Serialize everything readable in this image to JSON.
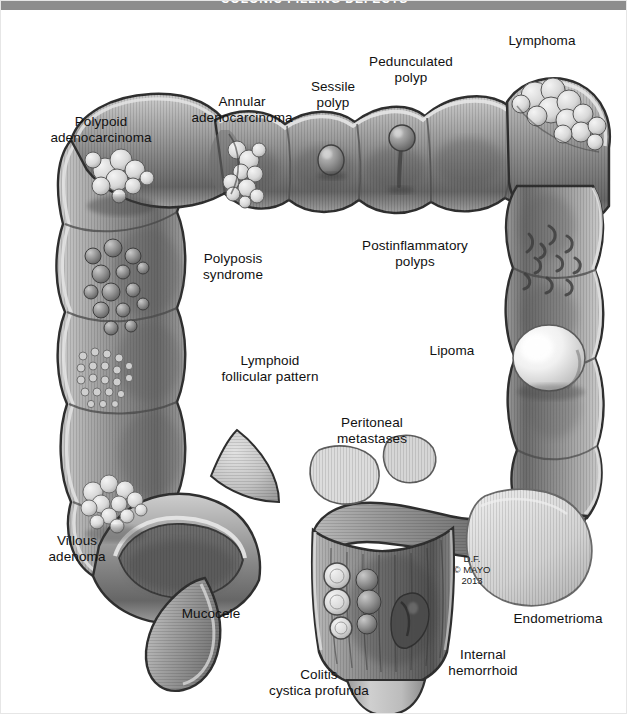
{
  "banner": {
    "text": "COLONIC FILLING DEFECTS"
  },
  "figure": {
    "credit": "D.F.\n© MAYO\n2013",
    "labels": [
      {
        "id": "polypoid-adenocarcinoma",
        "text": "Polypoid\nadenocarcinoma",
        "x": 30,
        "y": 104,
        "align": "c",
        "w": 140
      },
      {
        "id": "annular-adenocarcinoma",
        "text": "Annular\nadenocarcinoma",
        "x": 176,
        "y": 84,
        "align": "c",
        "w": 130
      },
      {
        "id": "sessile-polyp",
        "text": "Sessile\npolyp",
        "x": 297,
        "y": 69,
        "align": "c",
        "w": 70
      },
      {
        "id": "pedunculated-polyp",
        "text": "Pedunculated\npolyp",
        "x": 355,
        "y": 44,
        "align": "c",
        "w": 110
      },
      {
        "id": "lymphoma",
        "text": "Lymphoma",
        "x": 495,
        "y": 23,
        "align": "c",
        "w": 92
      },
      {
        "id": "postinflammatory-polyps",
        "text": "Postinflammatory\npolyps",
        "x": 348,
        "y": 228,
        "align": "c",
        "w": 132
      },
      {
        "id": "lipoma",
        "text": "Lipoma",
        "x": 420,
        "y": 333,
        "align": "c",
        "w": 62
      },
      {
        "id": "polyposis-syndrome",
        "text": "Polyposis\nsyndrome",
        "x": 186,
        "y": 241,
        "align": "c",
        "w": 92
      },
      {
        "id": "lymphoid-follicular",
        "text": "Lymphoid\nfollicular pattern",
        "x": 206,
        "y": 343,
        "align": "c",
        "w": 126
      },
      {
        "id": "peritoneal-metastases",
        "text": "Peritoneal\nmetastases",
        "x": 323,
        "y": 405,
        "align": "c",
        "w": 96
      },
      {
        "id": "villous-adenoma",
        "text": "Villous\nadenoma",
        "x": 34,
        "y": 523,
        "align": "c",
        "w": 84
      },
      {
        "id": "mucocele",
        "text": "Mucocele",
        "x": 168,
        "y": 596,
        "align": "c",
        "w": 84
      },
      {
        "id": "colitis-cystica-profunda",
        "text": "Colitis\ncystica profunda",
        "x": 255,
        "y": 657,
        "align": "c",
        "w": 126
      },
      {
        "id": "internal-hemorrhoid",
        "text": "Internal\nhemorrhoid",
        "x": 436,
        "y": 637,
        "align": "c",
        "w": 92
      },
      {
        "id": "endometrioma",
        "text": "Endometrioma",
        "x": 500,
        "y": 601,
        "align": "c",
        "w": 114
      }
    ]
  },
  "palette": {
    "banner_bg": "#8d8d8d",
    "page_bg": "#ffffff",
    "wall_outline": "#3a3a3a",
    "serosa_light": "#d7d7d7",
    "mucosa_mid": "#9a9a9a",
    "mucosa_dark": "#5e5e5e",
    "lumen_shadow": "#4a4a4a",
    "lesion_highlight": "#ececec",
    "text": "#111111"
  }
}
